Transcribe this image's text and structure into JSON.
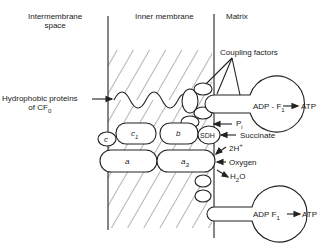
{
  "regions": {
    "intermembrane": "Intermembrane\nspace",
    "intermembrane_l1": "Intermembrane",
    "intermembrane_l2": "space",
    "inner": "Inner membrane",
    "matrix": "Matrix"
  },
  "labels": {
    "hydrophobic_l1": "Hydrophobic proteins",
    "hydrophobic_l2": "of CF",
    "hydrophobic_sub": "0",
    "coupling": "Coupling factors",
    "pi": "P",
    "pi_sub": "i",
    "succinate": "Succinate",
    "twoh": "2H",
    "twoh_sup": "+",
    "oxygen": "Oxygen",
    "h2o_h": "H",
    "h2o_sub": "2",
    "h2o_o": "O",
    "adp_f1_top": "ADP - F",
    "adp_f1_bottom": "ADP  F",
    "f1_sub": "1",
    "atp_top": "ATP",
    "atp_bottom": "ATP"
  },
  "complexes": {
    "c1": "c",
    "c1_sub": "1",
    "b": "b",
    "sdh": "SDH",
    "c": "c",
    "a": "a",
    "a3": "a",
    "a3_sub": "3"
  }
}
